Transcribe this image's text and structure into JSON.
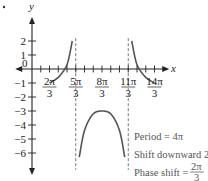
{
  "chart_data": {
    "type": "line",
    "title": "",
    "function": "y = -2 + 3 csc((x - 2π/3)/2) style graph",
    "xlabel": "x",
    "ylabel": "y",
    "origin_label": "0",
    "xlim_pi_thirds": [
      -1,
      15
    ],
    "ylim": [
      -7,
      3
    ],
    "x_ticks": [
      {
        "value_pi_thirds": 2,
        "num": "2π",
        "den": "3"
      },
      {
        "value_pi_thirds": 5,
        "num": "5π",
        "den": "3"
      },
      {
        "value_pi_thirds": 8,
        "num": "8π",
        "den": "3"
      },
      {
        "value_pi_thirds": 11,
        "num": "11π",
        "den": "3"
      },
      {
        "value_pi_thirds": 14,
        "num": "14π",
        "den": "3"
      }
    ],
    "y_ticks": [
      {
        "value": 2,
        "label": "2"
      },
      {
        "value": 1,
        "label": "1"
      },
      {
        "value": -1,
        "label": "−1"
      },
      {
        "value": -2,
        "label": "−2"
      },
      {
        "value": -3,
        "label": "−3"
      },
      {
        "value": -4,
        "label": "−4"
      },
      {
        "value": -5,
        "label": "−5"
      },
      {
        "value": -6,
        "label": "−6"
      }
    ],
    "asymptotes_pi_thirds": [
      5,
      11
    ],
    "series": [
      {
        "name": "left-branch",
        "points": [
          [
            2,
            -1
          ],
          [
            3,
            -0.6
          ],
          [
            4,
            0.3
          ],
          [
            4.6,
            2.0
          ]
        ]
      },
      {
        "name": "middle-branch",
        "points": [
          [
            5.4,
            -6.3
          ],
          [
            6,
            -4.4
          ],
          [
            7,
            -3.2
          ],
          [
            8,
            -3
          ],
          [
            9,
            -3.2
          ],
          [
            10,
            -4.4
          ],
          [
            10.6,
            -6.3
          ]
        ]
      },
      {
        "name": "right-branch",
        "points": [
          [
            11.4,
            2.0
          ],
          [
            12,
            0.3
          ],
          [
            13,
            -0.6
          ],
          [
            14,
            -1
          ]
        ]
      }
    ],
    "annotations": [
      {
        "text": "Period = 4π"
      },
      {
        "text": "Shift downward 2"
      },
      {
        "text": "Phase shift = ",
        "frac_num": "2π",
        "frac_den": "3"
      }
    ]
  }
}
